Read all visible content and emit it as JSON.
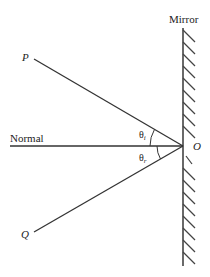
{
  "diagram": {
    "labels": {
      "mirror": "Mirror",
      "normal": "Normal",
      "incident_point": "P",
      "reflected_point": "Q",
      "origin": "O",
      "angle_incidence": "θ",
      "angle_incidence_sub": "i",
      "angle_reflection": "θ",
      "angle_reflection_sub": "r"
    },
    "colors": {
      "line": "#333333",
      "background": "#ffffff"
    }
  }
}
